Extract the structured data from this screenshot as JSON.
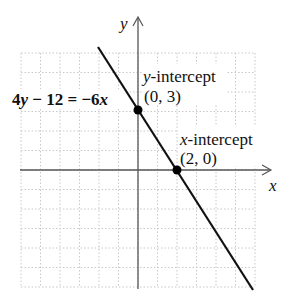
{
  "chart_data": {
    "type": "line",
    "title": "",
    "equation": "4y − 12 = −6x",
    "xlabel": "x",
    "ylabel": "y",
    "xlim": [
      -6,
      6
    ],
    "ylim": [
      -6,
      6
    ],
    "grid": true,
    "grid_style": "dotted",
    "series": [
      {
        "name": "4y − 12 = −6x",
        "slope": -1.5,
        "intercept": 3,
        "x": [
          -2,
          5.9
        ],
        "y": [
          6.1,
          -5.85
        ]
      }
    ],
    "points": [
      {
        "name": "y-intercept",
        "label": "y-intercept",
        "coords_label": "(0, 3)",
        "x": 0,
        "y": 3
      },
      {
        "name": "x-intercept",
        "label": "x-intercept",
        "coords_label": "(2, 0)",
        "x": 2,
        "y": 0
      }
    ],
    "annotations": [
      {
        "text": "4y − 12 = −6x",
        "position": "left of line near y-intercept"
      },
      {
        "text": "y-intercept (0, 3)"
      },
      {
        "text": "x-intercept (2, 0)"
      }
    ]
  },
  "labels": {
    "x_axis": "x",
    "y_axis": "y",
    "equation_lhs_coef": "4",
    "equation_lhs_var": "y",
    "equation_mid": " − 12 = −6",
    "equation_rhs_var": "x",
    "yint_var": "y",
    "yint_text": "-intercept",
    "yint_coords": "(0, 3)",
    "xint_var": "x",
    "xint_text": "-intercept",
    "xint_coords": "(2, 0)"
  },
  "colors": {
    "grid": "#c8c8c8",
    "axis": "#555555",
    "line": "#111111",
    "point": "#000000"
  }
}
